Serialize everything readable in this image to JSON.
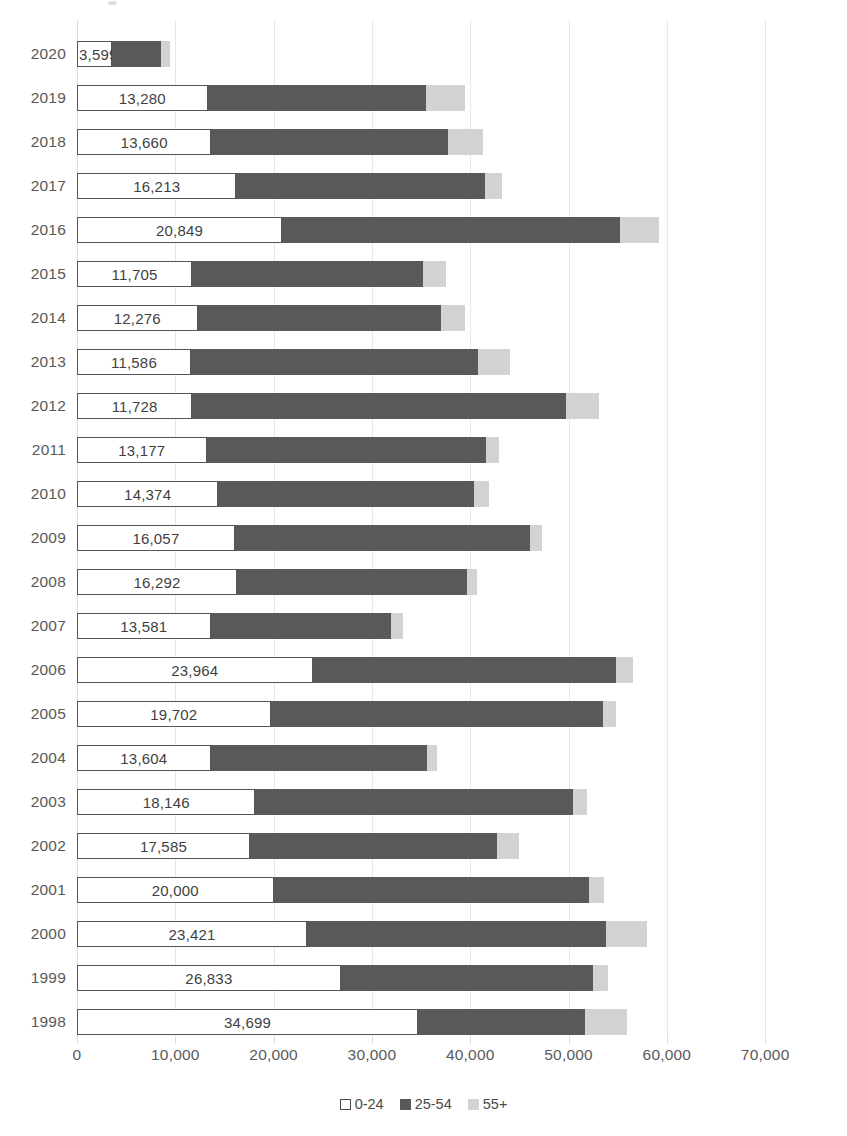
{
  "chart_data": {
    "type": "bar",
    "subtype": "stacked-horizontal-bar",
    "title": "",
    "subtitle": "",
    "xlabel": "",
    "ylabel": "",
    "xlim": [
      0,
      77000
    ],
    "xticks": [
      0,
      10000,
      20000,
      30000,
      40000,
      50000,
      60000,
      70000
    ],
    "xtick_labels": [
      "0",
      "10,000",
      "20,000",
      "30,000",
      "40,000",
      "50,000",
      "60,000",
      "70,000"
    ],
    "grid": true,
    "grid_axis": "x",
    "legend_position": "bottom",
    "legend": [
      "0-24",
      "25-54",
      "55+"
    ],
    "categories": [
      "2020",
      "2019",
      "2018",
      "2017",
      "2016",
      "2015",
      "2014",
      "2013",
      "2012",
      "2011",
      "2010",
      "2009",
      "2008",
      "2007",
      "2006",
      "2005",
      "2004",
      "2003",
      "2002",
      "2001",
      "2000",
      "1999",
      "1998"
    ],
    "series": [
      {
        "name": "0-24",
        "color": "#ffffff",
        "values": [
          3599,
          13280,
          13660,
          16213,
          20849,
          11705,
          12276,
          11586,
          11728,
          13177,
          14374,
          16057,
          16292,
          13581,
          23964,
          19702,
          13604,
          18146,
          17585,
          20000,
          23421,
          26833,
          34699
        ]
      },
      {
        "name": "25-54",
        "color": "#595959",
        "values": [
          4900,
          22200,
          24100,
          25300,
          34400,
          23500,
          24700,
          29200,
          38000,
          28400,
          26000,
          30000,
          23400,
          18400,
          30900,
          33800,
          22000,
          32300,
          25100,
          32100,
          30400,
          25700,
          17000
        ]
      },
      {
        "name": "55+",
        "color": "#d3d3d3",
        "values": [
          1000,
          4000,
          3500,
          1700,
          4000,
          2300,
          2500,
          3300,
          3400,
          1400,
          1500,
          1200,
          1000,
          1200,
          1700,
          1300,
          1000,
          1400,
          2300,
          1500,
          4200,
          1500,
          4200
        ]
      }
    ],
    "data_labels": {
      "series": "0-24",
      "values": [
        "3,599",
        "13,280",
        "13,660",
        "16,213",
        "20,849",
        "11,705",
        "12,276",
        "11,586",
        "11,728",
        "13,177",
        "14,374",
        "16,057",
        "16,292",
        "13,581",
        "23,964",
        "19,702",
        "13,604",
        "18,146",
        "17,585",
        "20,000",
        "23,421",
        "26,833",
        "34,699"
      ]
    }
  },
  "legend": {
    "items": [
      {
        "label": "0-24",
        "swatch_class": "sw-young"
      },
      {
        "label": "25-54",
        "swatch_class": "sw-mid"
      },
      {
        "label": "55+",
        "swatch_class": "sw-old"
      }
    ]
  }
}
